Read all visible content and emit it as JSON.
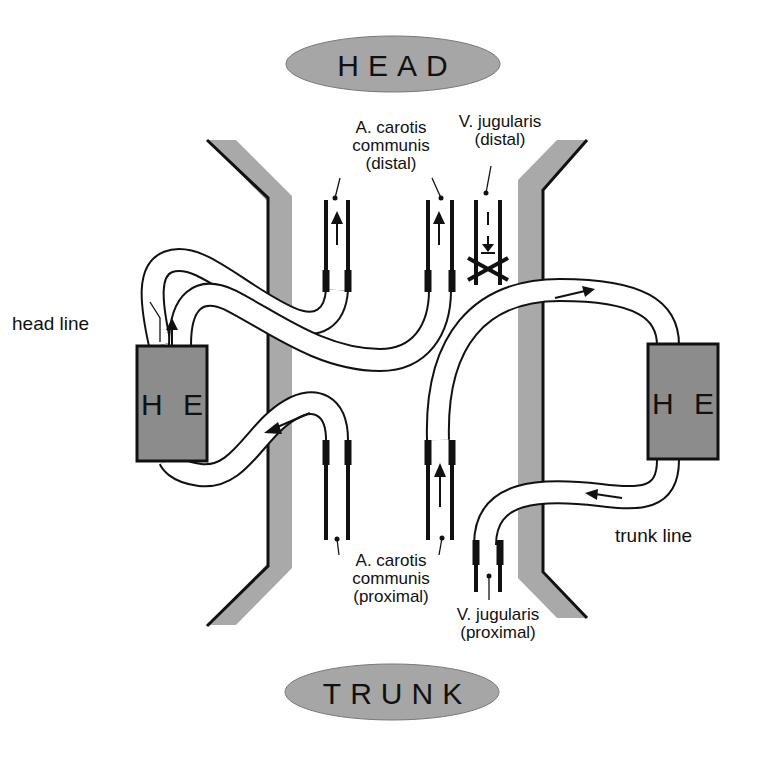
{
  "diagram": {
    "top_label": "HEAD",
    "bottom_label": "TRUNK",
    "left_exchanger": "H E",
    "right_exchanger": "H E",
    "head_line_label": "head line",
    "trunk_line_label": "trunk line",
    "vessels": {
      "carotis_distal": [
        "A. carotis",
        "communis",
        "(distal)"
      ],
      "jugularis_distal": [
        "V. jugularis",
        "(distal)"
      ],
      "carotis_proximal": [
        "A. carotis",
        "communis",
        "(proximal)"
      ],
      "jugularis_proximal": [
        "V. jugularis",
        "(proximal)"
      ]
    },
    "colors": {
      "wall_fill": "#a9a9a9",
      "exchanger_fill": "#8c8c8c",
      "oval_fill": "#a6a6a6",
      "line": "#111111"
    }
  }
}
